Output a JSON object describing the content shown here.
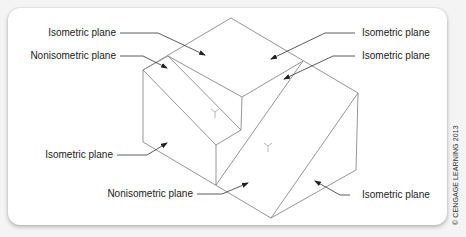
{
  "figure": {
    "labels": {
      "top_left_isometric": "Isometric plane",
      "top_left_nonisometric": "Nonisometric plane",
      "top_right_isometric_1": "Isometric plane",
      "top_right_isometric_2": "Isometric plane",
      "left_isometric": "Isometric plane",
      "bottom_nonisometric": "Nonisometric plane",
      "right_isometric": "Isometric plane"
    },
    "credit": "© CENGAGE LEARNING 2013",
    "colors": {
      "line": "#8a8a8a",
      "leader": "#333333",
      "text": "#222222",
      "background": "#f4f4f4",
      "card": "#ffffff"
    }
  }
}
